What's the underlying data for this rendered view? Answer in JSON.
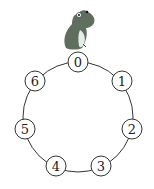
{
  "diagram": {
    "type": "circular-ring",
    "ring": {
      "cx": 78,
      "cy": 117,
      "r": 55,
      "stroke": "#333333"
    },
    "nodes": [
      {
        "label": "0",
        "x": 78,
        "y": 62
      },
      {
        "label": "1",
        "x": 122,
        "y": 81
      },
      {
        "label": "2",
        "x": 132,
        "y": 129
      },
      {
        "label": "3",
        "x": 101,
        "y": 166
      },
      {
        "label": "4",
        "x": 56,
        "y": 166
      },
      {
        "label": "5",
        "x": 25,
        "y": 129
      },
      {
        "label": "6",
        "x": 35,
        "y": 81
      }
    ],
    "character": {
      "name": "frog",
      "position_node": "0",
      "color": "#5f6e5e",
      "belly": "#e6ece6"
    }
  }
}
